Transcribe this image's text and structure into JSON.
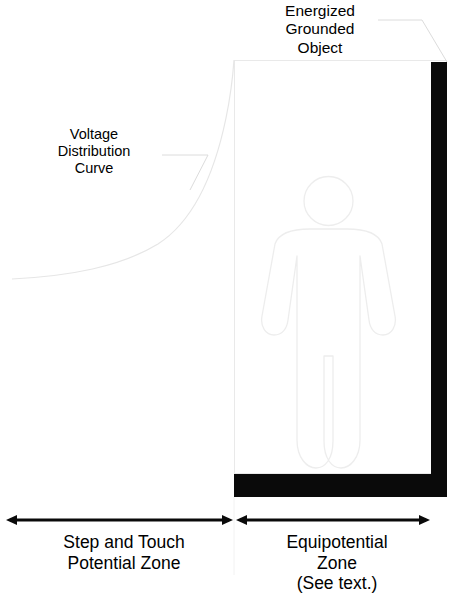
{
  "diagram": {
    "title_implied": "Equipotential zone and step and touch potential zone diagram",
    "labels": {
      "energized_object": "Energized\nGrounded\nObject",
      "voltage_curve": "Voltage\nDistribution\nCurve",
      "step_touch_zone": "Step and Touch\nPotential Zone",
      "equipotential_zone": "Equipotential\nZone\n(See text.)"
    },
    "colors": {
      "background": "#ffffff",
      "text": "#000000",
      "line_light": "#e9e9e9",
      "line_leader": "#d8d8d8",
      "solid_black": "#0a0a0a",
      "figure_outline": "#ededed"
    },
    "measure_arrows": [
      {
        "name": "step-and-touch-span",
        "x_start": 7,
        "x_end": 232,
        "y": 520,
        "double_headed": true
      },
      {
        "name": "equipotential-span",
        "x_start": 236,
        "x_end": 430,
        "y": 520,
        "double_headed": true
      }
    ],
    "shapes": {
      "equipotential_rect": {
        "x": 234,
        "y": 60,
        "width": 213,
        "height": 414
      },
      "ground_bar": {
        "x": 234,
        "y": 474,
        "width": 213,
        "height": 23
      },
      "energized_object_bar": {
        "x": 431,
        "y": 62,
        "width": 16,
        "height": 412
      },
      "person": {
        "head_cx": 328,
        "head_cy": 201,
        "head_r": 24,
        "body_top": 229,
        "feet_y": 474
      }
    },
    "voltage_curve_points": "M 12,279 C 70,276 120,267 158,244 C 192,222 214,176 226,118 C 231,94 233,74 234,60"
  }
}
